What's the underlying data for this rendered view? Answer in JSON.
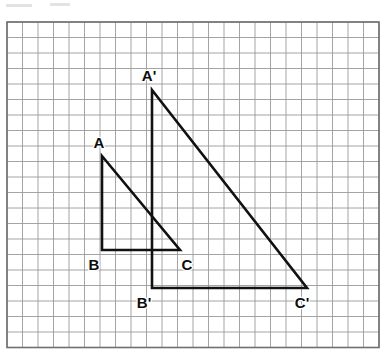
{
  "figure": {
    "background_color": "#ffffff"
  },
  "grid": {
    "origin_x": 7,
    "origin_y": 22,
    "cell_size": 15.5,
    "columns": 24,
    "rows": 21,
    "line_color": "#9a9a9a",
    "line_width": 0.9,
    "border_color": "#6f6f6f",
    "border_width": 1.6
  },
  "stroke": {
    "shape_color": "#111111",
    "shape_width": 2.6
  },
  "points": {
    "A": {
      "label": "A",
      "x": 102,
      "y": 156,
      "label_x": 99,
      "label_y": 148
    },
    "B": {
      "label": "B",
      "x": 102,
      "y": 250,
      "label_x": 94,
      "label_y": 270
    },
    "C": {
      "label": "C",
      "x": 180,
      "y": 250,
      "label_x": 187,
      "label_y": 270
    },
    "A_prime": {
      "label": "A'",
      "x": 152,
      "y": 90,
      "label_x": 149,
      "label_y": 81
    },
    "B_prime": {
      "label": "B'",
      "x": 152,
      "y": 288,
      "label_x": 144,
      "label_y": 308
    },
    "C_prime": {
      "label": "C'",
      "x": 307,
      "y": 288,
      "label_x": 302,
      "label_y": 308
    }
  },
  "shapes": [
    {
      "name": "triangle-ABC",
      "vertices": [
        "A",
        "B",
        "C"
      ]
    },
    {
      "name": "triangle-A-prime-B-prime-C-prime",
      "vertices": [
        "A_prime",
        "B_prime",
        "C_prime"
      ]
    }
  ],
  "artifacts": [
    {
      "x": 6,
      "y": 4,
      "width": 26
    },
    {
      "x": 50,
      "y": 3,
      "width": 20
    }
  ]
}
